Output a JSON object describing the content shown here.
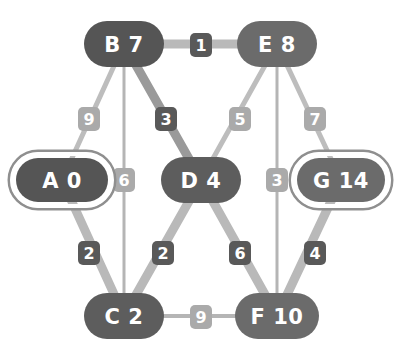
{
  "diagram": {
    "type": "node-link-graph",
    "background_color": "#ffffff",
    "palette": {
      "node_fill_dark": "#555555",
      "node_fill_mid": "#6b6b6b",
      "node_text": "#ffffff",
      "node_ring": "#ffffff",
      "edge_light": "#b9b9b9",
      "edge_dark": "#8f8f8f",
      "label_box_dark": "#595959",
      "label_box_light": "#aaaaaa",
      "label_text": "#ffffff"
    },
    "nodes": [
      {
        "id": "A",
        "name": "A",
        "dist": "0",
        "label": "A 0",
        "x": 62,
        "y": 180,
        "rx": 46,
        "ry": 22,
        "highlighted": true,
        "fill": "#555555",
        "shape": "rounded-rect-double-ring"
      },
      {
        "id": "B",
        "name": "B",
        "dist": "7",
        "label": "B 7",
        "x": 124,
        "y": 44,
        "rx": 40,
        "ry": 23,
        "highlighted": false,
        "fill": "#555555",
        "shape": "rounded-rect"
      },
      {
        "id": "C",
        "name": "C",
        "dist": "2",
        "label": "C 2",
        "x": 124,
        "y": 316,
        "rx": 40,
        "ry": 23,
        "highlighted": false,
        "fill": "#5d5d5d",
        "shape": "rounded-rect"
      },
      {
        "id": "D",
        "name": "D",
        "dist": "4",
        "label": "D 4",
        "x": 201,
        "y": 180,
        "rx": 40,
        "ry": 23,
        "highlighted": false,
        "fill": "#5d5d5d",
        "shape": "rounded-rect"
      },
      {
        "id": "E",
        "name": "E",
        "dist": "8",
        "label": "E 8",
        "x": 277,
        "y": 44,
        "rx": 40,
        "ry": 23,
        "highlighted": false,
        "fill": "#6b6b6b",
        "shape": "rounded-rect"
      },
      {
        "id": "F",
        "name": "F",
        "dist": "10",
        "label": "F 10",
        "x": 277,
        "y": 316,
        "rx": 42,
        "ry": 23,
        "highlighted": false,
        "fill": "#6b6b6b",
        "shape": "rounded-rect"
      },
      {
        "id": "G",
        "name": "G",
        "dist": "14",
        "label": "G 14",
        "x": 341,
        "y": 180,
        "rx": 44,
        "ry": 22,
        "highlighted": true,
        "fill": "#6b6b6b",
        "shape": "rounded-rect-double-ring"
      }
    ],
    "edges": [
      {
        "from": "B",
        "to": "E",
        "weight": "1",
        "lx": 201,
        "ly": 45,
        "style": "thick-light",
        "label_box": "dark",
        "stroke": "#b9b9b9",
        "width": 9
      },
      {
        "from": "A",
        "to": "B",
        "weight": "9",
        "lx": 89,
        "ly": 119,
        "style": "thin-light",
        "label_box": "light",
        "stroke": "#bdbdbd",
        "width": 5
      },
      {
        "from": "B",
        "to": "D",
        "weight": "3",
        "lx": 166,
        "ly": 119,
        "style": "thick-dark",
        "label_box": "dark",
        "stroke": "#9a9a9a",
        "width": 9
      },
      {
        "from": "B",
        "to": "C",
        "weight": "6",
        "lx": 124,
        "ly": 180,
        "style": "hairline",
        "label_box": "light",
        "stroke": "#b5b5b5",
        "width": 3
      },
      {
        "from": "D",
        "to": "E",
        "weight": "5",
        "lx": 240,
        "ly": 119,
        "style": "thin-light",
        "label_box": "light",
        "stroke": "#bdbdbd",
        "width": 5
      },
      {
        "from": "E",
        "to": "G",
        "weight": "7",
        "lx": 315,
        "ly": 119,
        "style": "thin-light",
        "label_box": "light",
        "stroke": "#bdbdbd",
        "width": 5
      },
      {
        "from": "E",
        "to": "F",
        "weight": "3",
        "lx": 277,
        "ly": 180,
        "style": "hairline",
        "label_box": "light",
        "stroke": "#b5b5b5",
        "width": 3
      },
      {
        "from": "A",
        "to": "C",
        "weight": "2",
        "lx": 89,
        "ly": 253,
        "style": "thick-light",
        "label_box": "dark",
        "stroke": "#b9b9b9",
        "width": 9
      },
      {
        "from": "C",
        "to": "D",
        "weight": "2",
        "lx": 163,
        "ly": 253,
        "style": "thick-light",
        "label_box": "dark",
        "stroke": "#b9b9b9",
        "width": 9
      },
      {
        "from": "D",
        "to": "F",
        "weight": "6",
        "lx": 240,
        "ly": 253,
        "style": "thick-light",
        "label_box": "dark",
        "stroke": "#b9b9b9",
        "width": 9
      },
      {
        "from": "F",
        "to": "G",
        "weight": "4",
        "lx": 315,
        "ly": 253,
        "style": "thick-light",
        "label_box": "dark",
        "stroke": "#b9b9b9",
        "width": 9
      },
      {
        "from": "C",
        "to": "F",
        "weight": "9",
        "lx": 201,
        "ly": 317,
        "style": "hairline",
        "label_box": "light",
        "stroke": "#b5b5b5",
        "width": 4
      }
    ]
  }
}
